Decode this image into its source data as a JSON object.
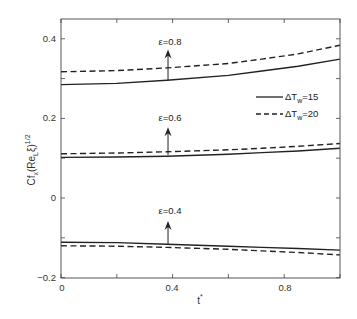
{
  "chart_data": {
    "type": "line",
    "title": "",
    "xlabel": "t*",
    "ylabel": "Cf_x (Re_L ξ)^1/2",
    "xlim": [
      0,
      1
    ],
    "ylim": [
      -0.2,
      0.45
    ],
    "x_ticks": [
      0,
      0.2,
      0.4,
      0.6,
      0.8,
      1.0
    ],
    "x_tick_labels": [
      "0",
      "",
      "0.4",
      "",
      "0.8",
      ""
    ],
    "y_ticks": [
      -0.2,
      -0.1,
      0,
      0.1,
      0.2,
      0.3,
      0.4
    ],
    "y_tick_labels": [
      "-0.2",
      "",
      "0",
      "",
      "0.2",
      "",
      "0.4"
    ],
    "grid": false,
    "legend_position": "right, upper-middle",
    "legend": [
      {
        "label": "ΔT_w=15",
        "style": "solid"
      },
      {
        "label": "ΔT_w=20",
        "style": "dashed"
      }
    ],
    "x": [
      0,
      0.2,
      0.38,
      0.6,
      0.72,
      0.85,
      1.0
    ],
    "series": [
      {
        "name": "ε=0.8, ΔT_w=15",
        "style": "solid",
        "values": [
          0.285,
          0.288,
          0.296,
          0.308,
          0.319,
          0.331,
          0.349
        ]
      },
      {
        "name": "ε=0.8, ΔT_w=20",
        "style": "dashed",
        "values": [
          0.317,
          0.32,
          0.327,
          0.338,
          0.349,
          0.362,
          0.384
        ]
      },
      {
        "name": "ε=0.6, ΔT_w=15",
        "style": "solid",
        "values": [
          0.102,
          0.103,
          0.105,
          0.11,
          0.114,
          0.118,
          0.125
        ]
      },
      {
        "name": "ε=0.6, ΔT_w=20",
        "style": "dashed",
        "values": [
          0.111,
          0.113,
          0.116,
          0.121,
          0.125,
          0.13,
          0.137
        ]
      },
      {
        "name": "ε=0.4, ΔT_w=15",
        "style": "solid",
        "values": [
          -0.111,
          -0.112,
          -0.116,
          -0.121,
          -0.124,
          -0.127,
          -0.131
        ]
      },
      {
        "name": "ε=0.4, ΔT_w=20",
        "style": "dashed",
        "values": [
          -0.12,
          -0.121,
          -0.124,
          -0.129,
          -0.133,
          -0.137,
          -0.143
        ]
      }
    ],
    "annotations": [
      {
        "text": "ε=0.8",
        "arrow_x": 0.38,
        "arrow_from": 0.296,
        "arrow_to": 0.373
      },
      {
        "text": "ε=0.6",
        "arrow_x": 0.38,
        "arrow_from": 0.108,
        "arrow_to": 0.178
      },
      {
        "text": "ε=0.4",
        "arrow_x": 0.38,
        "arrow_from": -0.116,
        "arrow_to": -0.058
      }
    ]
  },
  "labels": {
    "x_tick_0": "0",
    "x_tick_04": "0.4",
    "x_tick_08": "0.8",
    "y_tick_m02": "−0.2",
    "y_tick_0": "0",
    "y_tick_02": "0.2",
    "y_tick_04": "0.4",
    "xlabel": "t",
    "xlabel_sup": "*",
    "ylabel_main": "Cf",
    "ylabel_sub_x": "x",
    "ylabel_paren_open": "(Re",
    "ylabel_sub_L": "L",
    "ylabel_xi": "ξ)",
    "ylabel_sup": "1/2",
    "annot_08": "ε=0.8",
    "annot_06": "ε=0.6",
    "annot_04": "ε=0.4",
    "legend_1_prefix": "ΔT",
    "legend_1_sub": "w",
    "legend_1_suffix": "=15",
    "legend_2_prefix": "ΔT",
    "legend_2_sub": "w",
    "legend_2_suffix": "=20"
  }
}
